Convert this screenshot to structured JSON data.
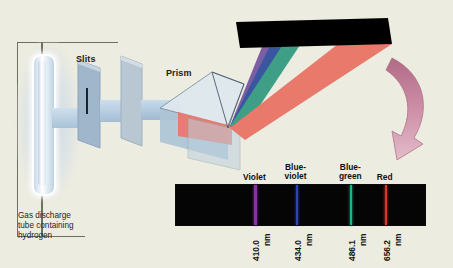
{
  "figure": {
    "background_color": "#edece0",
    "apparatus": {
      "source_caption": "Gas discharge\ntube containing\nhydrogen",
      "slits_label": "Slits",
      "prism_label": "Prism"
    },
    "beams": [
      {
        "name": "violet-beam",
        "color": "#7b5fa2"
      },
      {
        "name": "blue-beam",
        "color": "#3b56a0"
      },
      {
        "name": "green-beam",
        "color": "#3f9e86"
      },
      {
        "name": "red-beam",
        "color": "#e8796b"
      }
    ],
    "screen": {
      "name": "black-screen",
      "color": "#000000"
    },
    "arrow": {
      "name": "curved-arrow",
      "color": "#c98ca4"
    }
  },
  "spectrum": {
    "background_color": "#050505",
    "lines": [
      {
        "label": "Violet",
        "wavelength": "410.0",
        "unit": "nm",
        "color": "#8b2fa6",
        "x_pct": 31.5
      },
      {
        "label": "Blue-\nviolet",
        "wavelength": "434.0",
        "unit": "nm",
        "color": "#2f43b8",
        "x_pct": 48.0
      },
      {
        "label": "Blue-\ngreen",
        "wavelength": "486.1",
        "unit": "nm",
        "color": "#1eb48a",
        "x_pct": 70.0
      },
      {
        "label": "Red",
        "wavelength": "656.2",
        "unit": "nm",
        "color": "#e0342a",
        "x_pct": 236.0
      }
    ]
  }
}
